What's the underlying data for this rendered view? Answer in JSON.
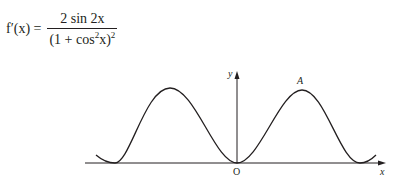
{
  "formula": {
    "lhs": "f′(x) =",
    "numerator": "2 sin 2x",
    "denominator_prefix": "(1 + cos",
    "denominator_exp": "2",
    "denominator_mid": "x)",
    "denominator_outer_exp": "2"
  },
  "graph": {
    "y_label": "y",
    "x_label": "x",
    "origin_label": "O",
    "point_label": "A"
  }
}
